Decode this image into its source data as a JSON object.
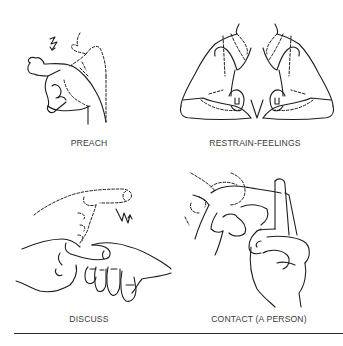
{
  "figures": [
    {
      "id": "preach",
      "caption": "PREACH",
      "motion_marks": [
        "zigzag-arrow"
      ]
    },
    {
      "id": "restrain-feelings",
      "caption": "RESTRAIN-FEELINGS",
      "motion_marks": []
    },
    {
      "id": "discuss",
      "caption": "DISCUSS",
      "motion_marks": [
        "zigzag-arrow"
      ]
    },
    {
      "id": "contact-a-person",
      "caption": "CONTACT (A PERSON)",
      "motion_marks": []
    }
  ],
  "colors": {
    "ink": "#1e1e1e",
    "caption": "#3a3a3a",
    "background": "#ffffff",
    "rule": "#2a2a2a"
  }
}
